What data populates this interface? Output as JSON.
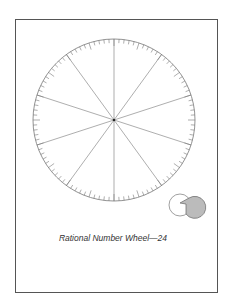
{
  "caption": "Rational Number Wheel—24",
  "wheel": {
    "center": [
      114,
      120
    ],
    "radius": 81,
    "ticks": 100,
    "major_every": 5,
    "spokes": 10,
    "stroke": "#777777"
  },
  "icon": {
    "name": "two-overlapping-circles-icon",
    "fill": "#bbbbbb"
  }
}
